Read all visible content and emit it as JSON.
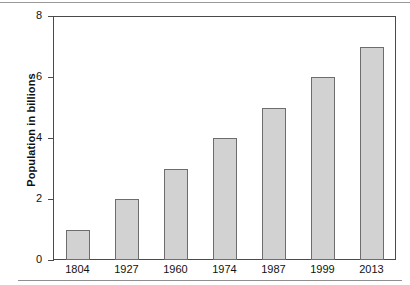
{
  "chart_data": {
    "type": "bar",
    "title": "",
    "subtitle": "",
    "xlabel": "",
    "ylabel": "Population in billions",
    "categories": [
      "1804",
      "1927",
      "1960",
      "1974",
      "1987",
      "1999",
      "2013"
    ],
    "values": [
      1,
      2,
      3,
      4,
      5,
      6,
      7
    ],
    "series": [
      {
        "name": "World population",
        "values": [
          1,
          2,
          3,
          4,
          5,
          6,
          7
        ]
      }
    ],
    "ylim": [
      0,
      8
    ],
    "ytick_labels": [
      "0",
      "2",
      "4",
      "6",
      "8"
    ],
    "ytick_values": [
      0,
      2,
      4,
      6,
      8
    ],
    "grid": false,
    "legend": false,
    "legend_position": "none",
    "annotations": [],
    "colors": {
      "bar_fill": "#d2d2d2",
      "bar_stroke": "#6d6d6d",
      "axis": "#4a4a4a",
      "text": "#111111",
      "background": "#ffffff"
    }
  }
}
